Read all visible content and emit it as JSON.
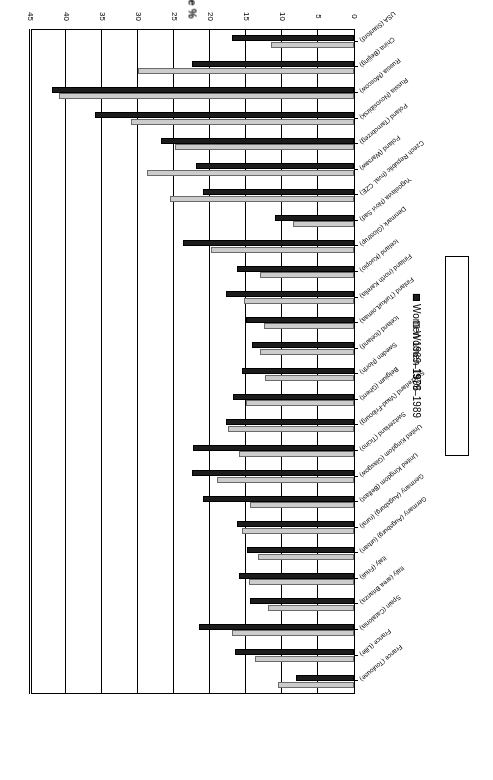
{
  "chart_data": {
    "type": "bar",
    "orientation": "horizontal",
    "title": "",
    "xlabel": "Prevalence %",
    "ylabel": "Centre",
    "xlim": [
      0,
      45
    ],
    "xticks": [
      0,
      5,
      10,
      15,
      20,
      25,
      30,
      35,
      40,
      45
    ],
    "grid": true,
    "legend_position": "right",
    "categories": [
      "France (Toulouse)",
      "France (Lille)",
      "Spain (Catalonia)",
      "Italy (area Brianza)",
      "Italy (Friuli)",
      "Germany (Augsburg) (urban)",
      "Germany (Augsburg) (rural)",
      "United Kingdom (Belfast)",
      "United Kingdom (Glasgow)",
      "Switzerland (Ticino)",
      "Switzerland (Vaud-Fribourg)",
      "Belgium (Ghent)",
      "Sweden (North)",
      "Iceland (Iceland)",
      "Finland (Turku/Loimaa)",
      "Finland (north Karelia)",
      "Iceland (Kuopio)",
      "Denmark (Glostrup)",
      "Yugoslavia (Novi Sad)",
      "Czech Republic (hval. CZE)",
      "Poland (Warsaw)",
      "Poland (Tarnobrzeg)",
      "Russia (Novosibirsk)",
      "Russia (Moscow)",
      "China (Beijing)",
      "USA (Stanford)"
    ],
    "series": [
      {
        "name": "Women 1979–1989",
        "color": "#cccccc",
        "values": [
          10.5,
          13.8,
          17.0,
          12.0,
          14.6,
          13.3,
          15.5,
          14.4,
          19.0,
          16.0,
          17.5,
          15.0,
          12.3,
          13.0,
          12.5,
          15.3,
          13.1,
          19.8,
          8.5,
          25.5,
          28.8,
          24.8,
          31.0,
          41.0,
          30.0,
          11.5
        ]
      },
      {
        "name": "Women 1969–1996",
        "color": "#1c1c1c",
        "values": [
          8.0,
          16.5,
          21.5,
          14.5,
          16.0,
          14.8,
          16.2,
          21.0,
          22.5,
          22.3,
          17.8,
          16.8,
          15.5,
          14.2,
          15.0,
          17.8,
          16.2,
          23.8,
          11.0,
          21.0,
          22.0,
          26.8,
          36.0,
          42.0,
          22.5,
          17.0
        ]
      }
    ]
  },
  "legend": {
    "entries": [
      {
        "label": "Women 1979–1989"
      },
      {
        "label": "Women 1969–1996"
      }
    ]
  },
  "axes": {
    "value_axis_title": "Prevalence %",
    "category_axis_title": "Centre"
  }
}
